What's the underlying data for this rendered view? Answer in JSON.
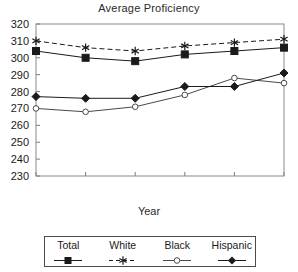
{
  "chart_data": {
    "type": "line",
    "title": "Average Proficiency",
    "xlabel": "Year",
    "ylabel": "",
    "categories": [
      "1973",
      "1978",
      "1982",
      "1988",
      "1990",
      "1992"
    ],
    "x": [
      1973,
      1978,
      1982,
      1988,
      1990,
      1992
    ],
    "ylim": [
      230,
      320
    ],
    "ytick_step": 10,
    "yticks": [
      "320",
      "310",
      "300",
      "290",
      "280",
      "270",
      "260",
      "250",
      "240",
      "230"
    ],
    "grid": false,
    "legend_position": "bottom",
    "series": [
      {
        "name": "Total",
        "values": [
          304,
          300,
          298,
          302,
          304,
          306
        ],
        "marker": "filled-square",
        "line_style": "solid",
        "color": "#1a1a1a"
      },
      {
        "name": "White",
        "values": [
          310,
          306,
          304,
          307,
          309,
          311
        ],
        "marker": "asterisk",
        "line_style": "dashed",
        "color": "#1a1a1a"
      },
      {
        "name": "Black",
        "values": [
          270,
          268,
          271,
          278,
          288,
          285
        ],
        "marker": "open-circle",
        "line_style": "solid",
        "color": "#4a4a4a"
      },
      {
        "name": "Hispanic",
        "values": [
          277,
          276,
          276,
          283,
          283,
          291
        ],
        "marker": "filled-diamond",
        "line_style": "solid",
        "color": "#1a1a1a"
      }
    ]
  },
  "legend": {
    "entries": [
      {
        "label": "Total"
      },
      {
        "label": "White"
      },
      {
        "label": "Black"
      },
      {
        "label": "Hispanic"
      }
    ]
  }
}
